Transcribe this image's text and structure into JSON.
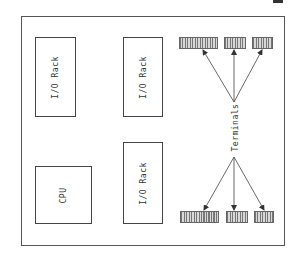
{
  "diagram": {
    "type": "system-block-diagram",
    "blocks": [
      {
        "id": "io-rack-1",
        "label": "I/O Rack"
      },
      {
        "id": "io-rack-2",
        "label": "I/O Rack"
      },
      {
        "id": "io-rack-3",
        "label": "I/O Rack"
      },
      {
        "id": "cpu",
        "label": "CPU"
      }
    ],
    "terminals_label": "Terminals",
    "terminal_groups": [
      {
        "position": "top",
        "count": 3
      },
      {
        "position": "bottom",
        "count": 3
      }
    ],
    "colors": {
      "line": "#444444",
      "background": "#ffffff",
      "terminal_fill": "#d8d8d8",
      "terminal_stripe": "#777777"
    }
  }
}
